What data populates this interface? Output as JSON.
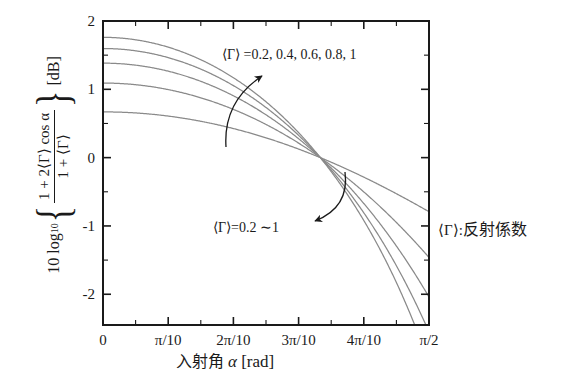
{
  "chart_data": {
    "type": "line",
    "title": "",
    "xlabel": "入射角 α [rad]",
    "ylabel": "10 log10 { (1 + 2⟨Γ⟩ cos α) / (1 + ⟨Γ⟩) } [dB]",
    "xlim": [
      0,
      1.5707963
    ],
    "ylim": [
      -2.45,
      2.0
    ],
    "grid": false,
    "legend_position": "annotation-inside",
    "x_tick_labels": [
      "0",
      "π/10",
      "2π/10",
      "3π/10",
      "4π/10",
      "π/2"
    ],
    "x_tick_values": [
      0,
      0.3141593,
      0.6283185,
      0.9424778,
      1.2566371,
      1.5707963
    ],
    "x_minor_step": 0.1570796,
    "y_tick_labels": [
      "2",
      "1",
      "0",
      "-1",
      "-2"
    ],
    "y_tick_values": [
      2,
      1,
      0,
      -1,
      -2
    ],
    "y_minor_step": 0.5,
    "series": [
      {
        "name": "⟨Γ⟩ = 0.2",
        "gamma": 0.2,
        "value_at_0_dB": 0.67,
        "value_at_pi_over_2_dB": -0.79
      },
      {
        "name": "⟨Γ⟩ = 0.4",
        "gamma": 0.4,
        "value_at_0_dB": 1.09,
        "value_at_pi_over_2_dB": -1.46
      },
      {
        "name": "⟨Γ⟩ = 0.6",
        "gamma": 0.6,
        "value_at_0_dB": 1.38,
        "value_at_pi_over_2_dB": -2.04
      },
      {
        "name": "⟨Γ⟩ = 0.8",
        "gamma": 0.8,
        "value_at_0_dB": 1.59,
        "value_at_pi_over_2_dB": -2.55
      },
      {
        "name": "⟨Γ⟩ = 1",
        "gamma": 1.0,
        "value_at_0_dB": 1.76,
        "value_at_pi_over_2_dB": -3.01
      }
    ],
    "convergence_point": {
      "x_rad": 1.0471976,
      "x_label": "π/3",
      "y_dB": 0
    },
    "annotations": [
      {
        "id": "top",
        "text": "⟨Γ⟩ =0.2, 0.4, 0.6, 0.8, 1",
        "arrow": "curved-up-right"
      },
      {
        "id": "bottom",
        "text": "⟨Γ⟩=0.2 ∼1",
        "arrow": "curved-down-left"
      },
      {
        "id": "legend",
        "text": "⟨Γ⟩: 反射係数"
      }
    ],
    "curve_color": "#8a8a8a",
    "axis_color": "#1a1a1a"
  },
  "axis": {
    "x_ticks": [
      "0",
      "π/10",
      "2π/10",
      "3π/10",
      "4π/10",
      "π/2"
    ],
    "y_ticks": [
      "2",
      "1",
      "0",
      "-1",
      "-2"
    ],
    "xlabel_jp": "入射角",
    "xlabel_var": "α",
    "xlabel_unit": "[rad]"
  },
  "ylabel": {
    "lead": "10 log",
    "lead_sub": "10",
    "numerator": "1 + 2⟨Γ⟩ cos α",
    "denominator": "1 + ⟨Γ⟩",
    "unit": "[dB]"
  },
  "annotations": {
    "top_label": "⟨Γ⟩ =0.2, 0.4, 0.6, 0.8, 1",
    "bottom_label": "⟨Γ⟩=0.2 ∼1",
    "legend_symbol": "⟨Γ⟩",
    "legend_separator": ":",
    "legend_meaning": "反射係数"
  }
}
